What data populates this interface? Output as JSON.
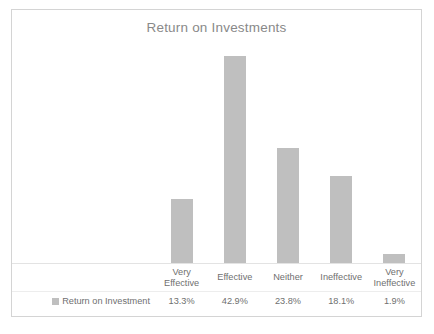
{
  "chart_data": {
    "type": "bar",
    "title": "Return on Investments",
    "xlabel": "",
    "ylabel": "",
    "grid": false,
    "legend_position": "data-table-row",
    "ylim": [
      0,
      46
    ],
    "categories": [
      "Very Effective",
      "Effective",
      "Neither",
      "Ineffective",
      "Very Ineffective"
    ],
    "category_lines": [
      [
        "Very",
        "Effective"
      ],
      [
        "Effective"
      ],
      [
        "Neither"
      ],
      [
        "Ineffective"
      ],
      [
        "Very",
        "Ineffective"
      ]
    ],
    "series": [
      {
        "name": "Return on Investment",
        "values": [
          13.3,
          42.9,
          23.8,
          18.1,
          1.9
        ],
        "value_labels": [
          "13.3%",
          "42.9%",
          "23.8%",
          "18.1%",
          "1.9%"
        ],
        "color": "#bfbfbf"
      }
    ]
  },
  "colors": {
    "bar": "#bfbfbf",
    "title_text": "#898989",
    "table_text": "#6f6f6f",
    "frame_border": "#d4d4d4",
    "table_gridline": "#ededed",
    "background": "#ffffff"
  }
}
